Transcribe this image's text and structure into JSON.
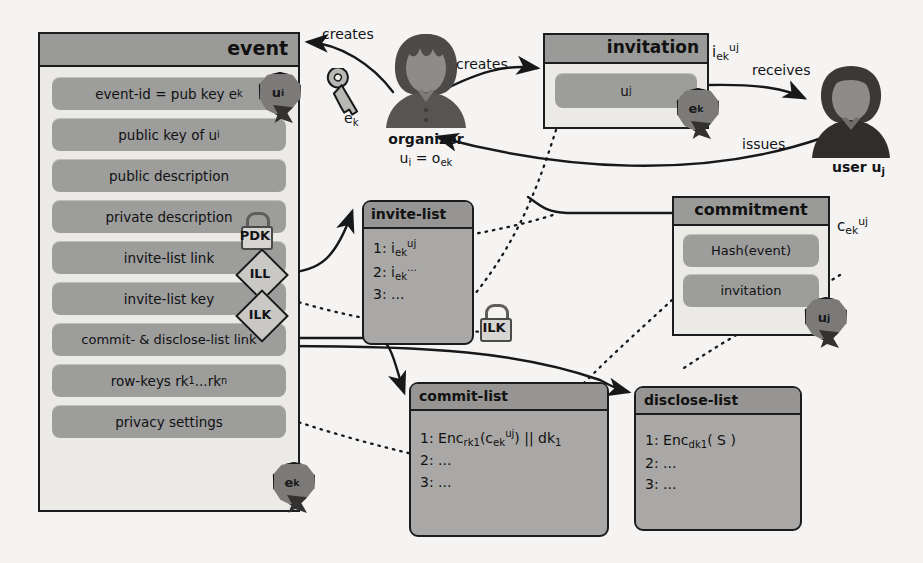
{
  "event_box": {
    "title": "event",
    "fields": [
      {
        "label": "event-id = pub key e",
        "sub": "k",
        "name": "event-id-field"
      },
      {
        "label": "public key of u",
        "sub": "i",
        "name": "public-key-field"
      },
      {
        "label": "public description",
        "sub": "",
        "name": "public-description-field"
      },
      {
        "label": "private description",
        "sub": "",
        "name": "private-description-field"
      },
      {
        "label": "invite-list link",
        "sub": "",
        "name": "invite-list-link-field"
      },
      {
        "label": "invite-list key",
        "sub": "",
        "name": "invite-list-key-field"
      },
      {
        "label": "commit- & disclose-list link",
        "sub": "",
        "name": "commit-disclose-list-link-field"
      },
      {
        "label": "row-keys rk",
        "sub": "1",
        "label2": "...rk",
        "sub2": "n",
        "name": "row-keys-field"
      },
      {
        "label": "privacy settings",
        "sub": "",
        "name": "privacy-settings-field"
      }
    ],
    "seal_event_id": {
      "base": "u",
      "sub": "i"
    },
    "seal_bottom": {
      "base": "e",
      "sub": "k"
    },
    "pdk_lock": "PDK",
    "ill_token": "ILL",
    "ilk_token": "ILK"
  },
  "organizer": {
    "name": "organizer",
    "identity_base": "u",
    "identity_sub": "i",
    "identity_eq": " = o",
    "identity_sub2": "ek",
    "key_label_base": "e",
    "key_label_sub": "k"
  },
  "user": {
    "name": "user ",
    "id_base": "u",
    "id_sub": "j"
  },
  "invitation_box": {
    "title": "invitation",
    "field_base": "u",
    "field_sub": "j",
    "seal": {
      "base": "e",
      "sub": "k"
    },
    "id_base": "i",
    "id_sub": "ek",
    "id_sup": "uj"
  },
  "commitment_box": {
    "title": "commitment",
    "fields": [
      "Hash(event)",
      "invitation"
    ],
    "seal": {
      "base": "u",
      "sub": "j"
    },
    "id_base": "c",
    "id_sub": "ek",
    "id_sup": "uj"
  },
  "invite_list": {
    "title": "invite-list",
    "rows": [
      {
        "n": "1: ",
        "base": "i",
        "sub": "ek",
        "sup": "uj"
      },
      {
        "n": "2: ",
        "base": "i",
        "sub": "ek",
        "sup": "..."
      },
      {
        "n": "3: ",
        "base": "...",
        "sub": "",
        "sup": ""
      }
    ],
    "lock_label": "ILK"
  },
  "commit_list": {
    "title": "commit-list",
    "rows": [
      {
        "n": "1: ",
        "fn": "Enc",
        "sub": "rk1",
        "arg_open": "(c",
        "arg_sub": "ek",
        "arg_sup": "uj",
        "arg_close": ")",
        "tail": " || dk",
        "tail_sub": "1"
      },
      {
        "n": "2: ",
        "fn": "...",
        "sub": "",
        "arg_open": "",
        "arg_sub": "",
        "arg_sup": "",
        "arg_close": "",
        "tail": "",
        "tail_sub": ""
      },
      {
        "n": "3: ",
        "fn": "...",
        "sub": "",
        "arg_open": "",
        "arg_sub": "",
        "arg_sup": "",
        "arg_close": "",
        "tail": "",
        "tail_sub": ""
      }
    ]
  },
  "disclose_list": {
    "title": "disclose-list",
    "rows": [
      {
        "n": "1: ",
        "fn": "Enc",
        "sub": "dk1",
        "arg": "( S )"
      },
      {
        "n": "2: ",
        "fn": "...",
        "sub": "",
        "arg": ""
      },
      {
        "n": "3: ",
        "fn": "...",
        "sub": "",
        "arg": ""
      }
    ]
  },
  "edges": {
    "creates_event": "creates",
    "creates_invitation": "creates",
    "receives": "receives",
    "issues": "issues"
  },
  "colors": {
    "page_bg": "#f5f4f2",
    "panel_bg": "#eceae7",
    "header_gray": "#9a9a98",
    "field_gray": "#9d9d9b",
    "list_gray": "#a9a8a6",
    "ink": "#17181a",
    "seal_gray": "#7b7a78"
  }
}
